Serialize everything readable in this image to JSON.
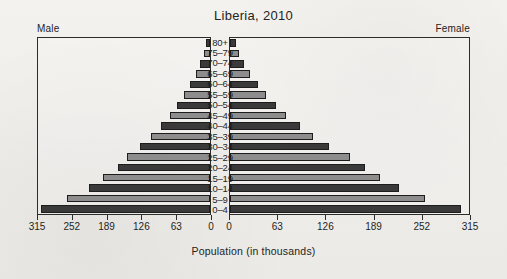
{
  "chart_data": {
    "type": "bar",
    "subtype": "population-pyramid",
    "title": "Liberia, 2010",
    "xlabel": "Population (in thousands)",
    "ylabel": "",
    "left_label": "Male",
    "right_label": "Female",
    "categories": [
      "0–4",
      "5–9",
      "10–14",
      "15–19",
      "20–24",
      "25–29",
      "30–34",
      "35–39",
      "40–44",
      "45–49",
      "50–54",
      "55–59",
      "60–64",
      "65–69",
      "70–74",
      "75–79",
      "80+"
    ],
    "series": [
      {
        "name": "Male",
        "side": "left",
        "values": [
          310,
          262,
          222,
          196,
          168,
          152,
          128,
          108,
          90,
          74,
          60,
          47,
          36,
          26,
          18,
          11,
          7
        ]
      },
      {
        "name": "Female",
        "side": "right",
        "values": [
          305,
          257,
          223,
          198,
          178,
          158,
          130,
          110,
          92,
          74,
          61,
          48,
          37,
          27,
          19,
          12,
          8
        ]
      }
    ],
    "xticks_left": [
      315,
      252,
      189,
      126,
      63,
      0
    ],
    "xticks_right": [
      0,
      63,
      126,
      189,
      252,
      315
    ],
    "xlim_left": [
      0,
      315
    ],
    "xlim_right": [
      0,
      315
    ],
    "grid": false,
    "legend": "none",
    "colors": {
      "bar_dark": "#3a3a3a",
      "bar_light": "#8d8d8d",
      "frame": "#2c2c2c",
      "background": "#f1efec",
      "text": "#1f1f1f"
    }
  }
}
